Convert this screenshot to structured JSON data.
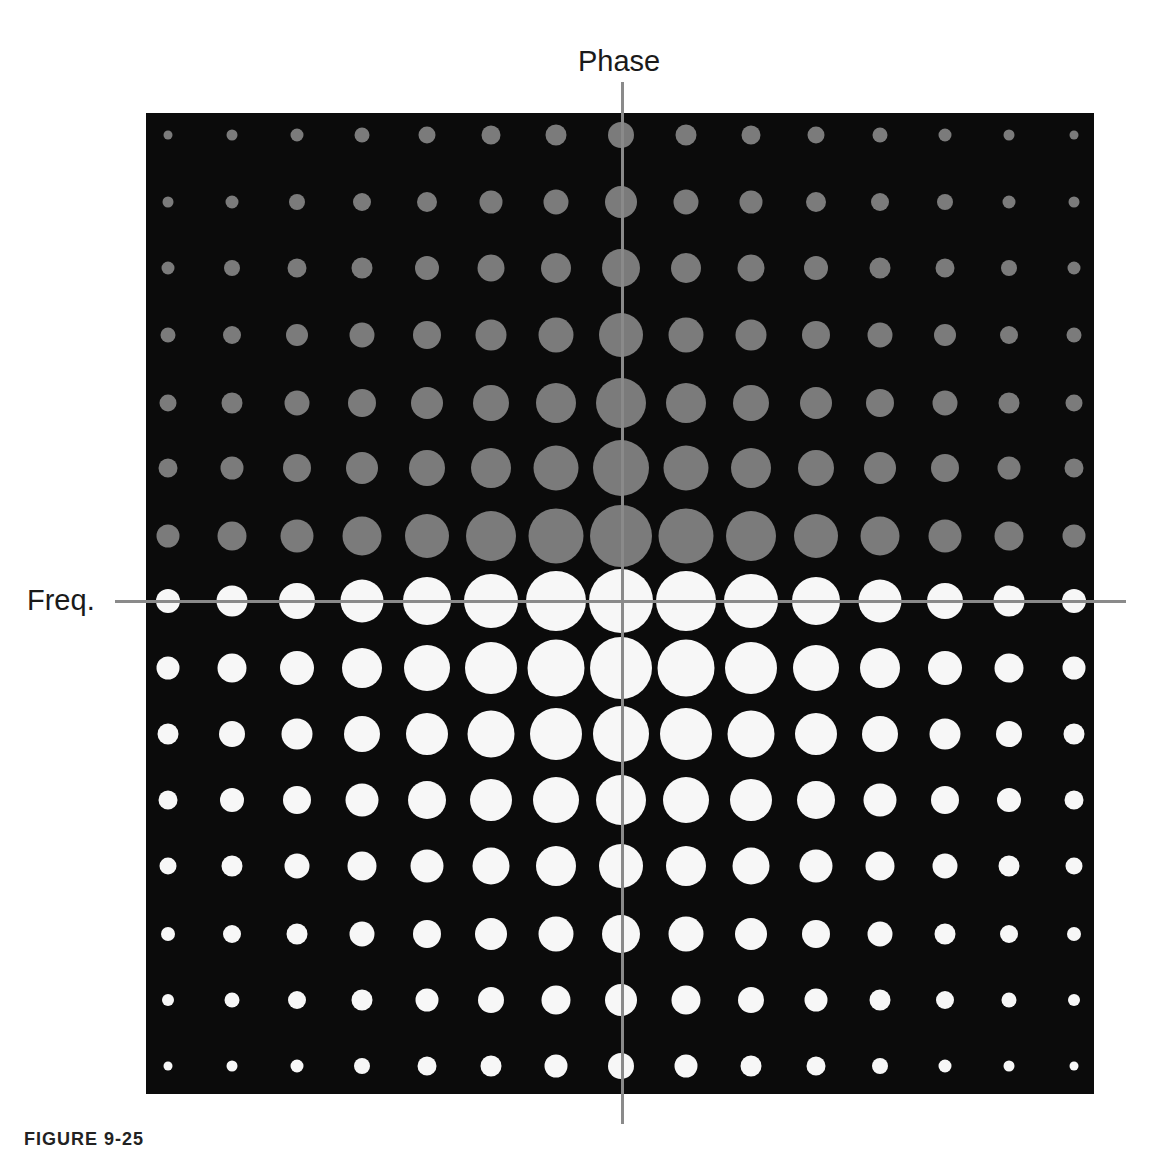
{
  "figure": {
    "caption": "FIGURE 9-25",
    "colors": {
      "background": "#ffffff",
      "panel": "#0b0b0b",
      "upper_half_dots": "#7b7b7b",
      "lower_half_dots": "#f7f7f7",
      "axis_lines": "#8a8a8a",
      "label_text": "#1a1a1a"
    }
  },
  "axes": {
    "vertical_label": "Phase",
    "horizontal_label": "Freq."
  },
  "chart_data": {
    "type": "scatter",
    "title": "",
    "xlabel": "Freq.",
    "ylabel": "Phase",
    "grid_columns": 15,
    "grid_rows": 15,
    "grid": false,
    "legend": null,
    "column_centers_px": [
      168,
      232,
      297,
      362,
      427,
      491,
      556,
      621,
      686,
      751,
      816,
      880,
      945,
      1009,
      1074
    ],
    "row_centers_px": [
      135,
      202,
      268,
      335,
      403,
      468,
      536,
      601,
      668,
      734,
      800,
      866,
      934,
      1000,
      1066
    ],
    "row_colors": [
      "gray",
      "gray",
      "gray",
      "gray",
      "gray",
      "gray",
      "gray",
      "white",
      "white",
      "white",
      "white",
      "white",
      "white",
      "white",
      "white"
    ],
    "diameters_px": [
      [
        9,
        11,
        13,
        15,
        17,
        19,
        21,
        26,
        21,
        19,
        17,
        15,
        13,
        11,
        9
      ],
      [
        11,
        13,
        16,
        18,
        20,
        23,
        25,
        32,
        25,
        23,
        20,
        18,
        16,
        13,
        11
      ],
      [
        13,
        16,
        19,
        21,
        24,
        27,
        30,
        38,
        30,
        27,
        24,
        21,
        19,
        16,
        13
      ],
      [
        15,
        18,
        22,
        25,
        28,
        31,
        35,
        44,
        35,
        31,
        28,
        25,
        22,
        18,
        15
      ],
      [
        17,
        21,
        25,
        28,
        32,
        36,
        40,
        50,
        40,
        36,
        32,
        28,
        25,
        21,
        17
      ],
      [
        19,
        23,
        28,
        32,
        36,
        40,
        45,
        56,
        45,
        40,
        36,
        32,
        28,
        23,
        19
      ],
      [
        23,
        29,
        33,
        39,
        44,
        50,
        55,
        62,
        55,
        50,
        44,
        39,
        33,
        29,
        23
      ],
      [
        24,
        31,
        36,
        43,
        48,
        54,
        60,
        64,
        60,
        54,
        48,
        43,
        36,
        31,
        24
      ],
      [
        23,
        29,
        34,
        40,
        46,
        52,
        57,
        62,
        57,
        52,
        46,
        40,
        34,
        29,
        23
      ],
      [
        21,
        26,
        31,
        36,
        42,
        47,
        52,
        56,
        52,
        47,
        42,
        36,
        31,
        26,
        21
      ],
      [
        19,
        24,
        28,
        33,
        38,
        42,
        46,
        50,
        46,
        42,
        38,
        33,
        28,
        24,
        19
      ],
      [
        17,
        21,
        25,
        29,
        33,
        37,
        40,
        44,
        40,
        37,
        33,
        29,
        25,
        21,
        17
      ],
      [
        14,
        18,
        21,
        25,
        28,
        32,
        35,
        38,
        35,
        32,
        28,
        25,
        21,
        18,
        14
      ],
      [
        12,
        15,
        18,
        21,
        23,
        26,
        29,
        32,
        29,
        26,
        23,
        21,
        18,
        15,
        12
      ],
      [
        9,
        11,
        13,
        16,
        19,
        21,
        23,
        26,
        23,
        21,
        19,
        16,
        13,
        11,
        9
      ]
    ]
  }
}
